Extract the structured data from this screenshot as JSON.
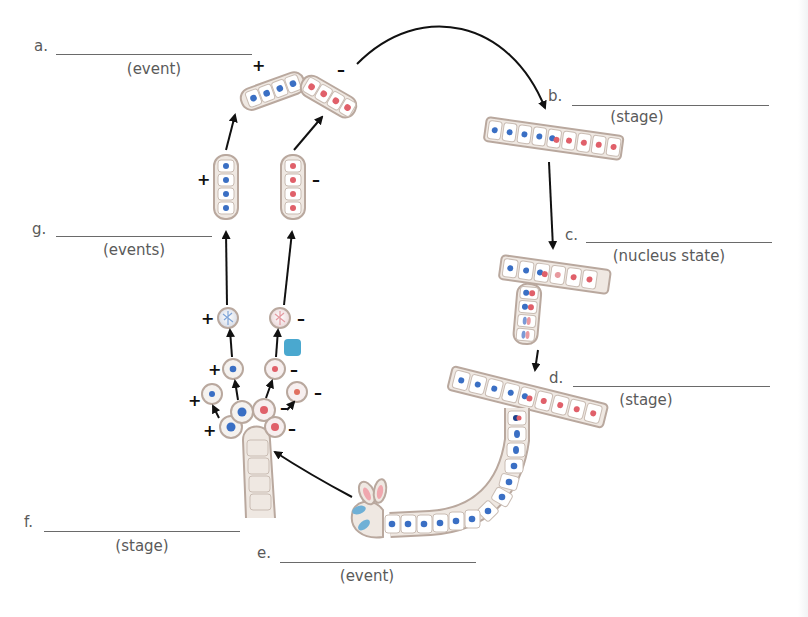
{
  "labels": {
    "a": {
      "letter": "a.",
      "hint": "(event)"
    },
    "b": {
      "letter": "b.",
      "hint": "(stage)"
    },
    "c": {
      "letter": "c.",
      "hint": "(nucleus state)"
    },
    "d": {
      "letter": "d.",
      "hint": "(stage)"
    },
    "e": {
      "letter": "e.",
      "hint": "(event)"
    },
    "f": {
      "letter": "f.",
      "hint": "(stage)"
    },
    "g": {
      "letter": "g.",
      "hint": "(events)"
    }
  },
  "mating_types": {
    "plus": "+",
    "minus": "–"
  },
  "colors": {
    "plus_nucleus": "#3a6fc4",
    "minus_nucleus": "#e0606a",
    "cell_wall": "#b9a89e",
    "cell_fill": "#efe8e2",
    "arrow": "#111111",
    "marker_square": "#4aa8cf",
    "text": "#5a5a5a"
  }
}
